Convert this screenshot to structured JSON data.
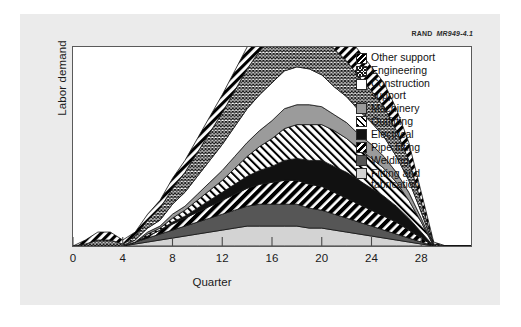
{
  "figure": {
    "credit_org": "RAND",
    "credit_code": "MR949-4.1"
  },
  "chart_data": {
    "type": "area",
    "stacked": true,
    "title": "",
    "xlabel": "Quarter",
    "ylabel": "Labor demand",
    "xlim": [
      0,
      32
    ],
    "ylim": [
      0,
      100
    ],
    "xticks": [
      0,
      4,
      8,
      12,
      16,
      20,
      24,
      28
    ],
    "ytick_labels": [],
    "grid": false,
    "legend_position": "right-inside",
    "x": [
      0,
      1,
      2,
      3,
      4,
      5,
      6,
      7,
      8,
      9,
      10,
      11,
      12,
      13,
      14,
      15,
      16,
      17,
      18,
      19,
      20,
      21,
      22,
      23,
      24,
      25,
      26,
      27,
      28,
      29,
      30,
      31,
      32
    ],
    "series": [
      {
        "name": "Fitting and fabrication",
        "pattern": "solid-light-gray",
        "color": "#d3d3d3",
        "values": [
          0,
          0,
          0,
          0,
          0,
          1,
          2,
          3,
          4,
          5,
          6,
          7,
          8,
          9,
          10,
          10,
          10,
          10,
          10,
          9,
          9,
          8,
          7,
          6,
          5,
          4,
          3,
          2,
          1,
          0,
          0,
          0,
          0
        ]
      },
      {
        "name": "Welding",
        "pattern": "solid-dark-gray",
        "color": "#565656",
        "values": [
          0,
          0,
          0,
          0,
          0,
          1,
          2,
          3,
          4,
          5,
          6,
          7,
          8,
          9,
          10,
          11,
          11,
          11,
          11,
          10,
          9,
          8,
          7,
          6,
          5,
          4,
          3,
          2,
          1,
          0,
          0,
          0,
          0
        ]
      },
      {
        "name": "Pipe fitting",
        "pattern": "diagonal-black-coarse",
        "color": "#000000",
        "values": [
          0,
          0,
          0,
          0,
          0,
          0,
          1,
          2,
          3,
          4,
          5,
          6,
          7,
          8,
          9,
          10,
          11,
          12,
          12,
          12,
          12,
          11,
          10,
          9,
          8,
          7,
          6,
          4,
          2,
          0,
          0,
          0,
          0
        ]
      },
      {
        "name": "Electrical",
        "pattern": "solid-black",
        "color": "#111111",
        "values": [
          0,
          0,
          0,
          0,
          0,
          0,
          0,
          0,
          1,
          1,
          2,
          3,
          4,
          5,
          6,
          7,
          8,
          10,
          11,
          12,
          13,
          13,
          13,
          12,
          11,
          10,
          8,
          6,
          3,
          0,
          0,
          0,
          0
        ]
      },
      {
        "name": "Outfitting",
        "pattern": "diagonal-white-fine",
        "color": "#ffffff",
        "values": [
          0,
          0,
          0,
          0,
          0,
          0,
          1,
          1,
          2,
          3,
          4,
          5,
          6,
          8,
          10,
          12,
          14,
          16,
          17,
          18,
          18,
          18,
          17,
          16,
          15,
          14,
          12,
          9,
          5,
          0,
          0,
          0,
          0
        ]
      },
      {
        "name": "Machinery",
        "pattern": "solid-medium-gray",
        "color": "#9b9b9b",
        "values": [
          0,
          0,
          0,
          0,
          0,
          0,
          1,
          1,
          2,
          2,
          3,
          4,
          5,
          6,
          7,
          8,
          9,
          10,
          10,
          10,
          9,
          8,
          8,
          7,
          7,
          6,
          5,
          4,
          2,
          0,
          0,
          0,
          0
        ]
      },
      {
        "name": "Construction support",
        "pattern": "solid-white",
        "color": "#ffffff",
        "values": [
          0,
          0,
          0,
          0,
          0,
          1,
          2,
          3,
          5,
          7,
          9,
          11,
          13,
          15,
          17,
          18,
          19,
          19,
          19,
          18,
          16,
          14,
          13,
          12,
          11,
          10,
          8,
          6,
          3,
          0,
          0,
          0,
          0
        ]
      },
      {
        "name": "Engineering",
        "pattern": "crosshatch-fine",
        "color": "#1a1a1a",
        "values": [
          0,
          1,
          3,
          3,
          1,
          2,
          4,
          6,
          8,
          10,
          12,
          14,
          16,
          18,
          20,
          22,
          23,
          24,
          24,
          23,
          21,
          19,
          18,
          17,
          16,
          15,
          13,
          10,
          5,
          1,
          0,
          0,
          0
        ]
      },
      {
        "name": "Other support",
        "pattern": "diagonal-black-bold",
        "color": "#000000",
        "values": [
          0,
          2,
          4,
          4,
          2,
          2,
          3,
          4,
          5,
          6,
          7,
          8,
          9,
          10,
          11,
          12,
          13,
          14,
          15,
          16,
          15,
          14,
          13,
          13,
          12,
          12,
          11,
          9,
          5,
          1,
          0,
          0,
          0
        ]
      }
    ]
  },
  "legend": {
    "items": [
      {
        "label": "Other support",
        "pattern_class": "lw-other"
      },
      {
        "label": "Engineering",
        "pattern_class": "lw-eng"
      },
      {
        "label": "Construction\nsupport",
        "pattern_class": "lw-constr"
      },
      {
        "label": "Machinery",
        "pattern_class": "lw-mach"
      },
      {
        "label": "Outfitting",
        "pattern_class": "lw-outfit"
      },
      {
        "label": "Electrical",
        "pattern_class": "lw-elec"
      },
      {
        "label": "Pipe fitting",
        "pattern_class": "lw-pipe"
      },
      {
        "label": "Welding",
        "pattern_class": "lw-weld"
      },
      {
        "label": "Fitting and\nfabrication",
        "pattern_class": "lw-fit"
      }
    ]
  }
}
